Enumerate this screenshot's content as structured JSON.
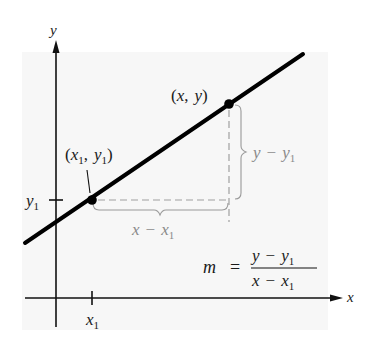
{
  "diagram": {
    "colors": {
      "background": "#ffffff",
      "panel": "#f7f7f7",
      "line": "#000000",
      "axes": "#111111",
      "guides": "#9a9a9a",
      "guide_labels": "#8a8a8a"
    },
    "axes": {
      "x_label": "x",
      "y_label": "y"
    },
    "ticks": {
      "x1": {
        "base": "x",
        "sub": "1"
      },
      "y1": {
        "base": "y",
        "sub": "1"
      }
    },
    "points": {
      "p1": {
        "open": "(",
        "x": "x",
        "x_sub": "1",
        "sep": ",",
        "y": "y",
        "y_sub": "1",
        "close": ")"
      },
      "p2": {
        "open": "(",
        "x": "x",
        "sep": ",",
        "y": "y",
        "close": ")"
      }
    },
    "braces": {
      "vertical": {
        "a": "y",
        "minus": "−",
        "b": "y",
        "b_sub": "1"
      },
      "horizontal": {
        "a": "x",
        "minus": "−",
        "b": "x",
        "b_sub": "1"
      }
    },
    "formula": {
      "lhs": "m",
      "equals": "=",
      "num_a": "y",
      "num_minus": "−",
      "num_b": "y",
      "num_sub": "1",
      "den_a": "x",
      "den_minus": "−",
      "den_b": "x",
      "den_sub": "1"
    }
  }
}
